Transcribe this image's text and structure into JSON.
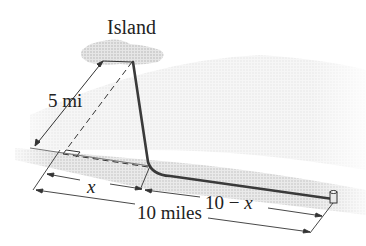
{
  "figure": {
    "island_label": "Island",
    "distance_offshore_label": "5 mi",
    "x_label": "x",
    "remaining_label_num": "10 − ",
    "remaining_label_var": "x",
    "total_label": "10 miles"
  },
  "colors": {
    "cable": "#3a3a3a",
    "dimension_lines": "#333333",
    "water_shading": "#d4d4d4",
    "land_shading": "#c8c8c8"
  }
}
